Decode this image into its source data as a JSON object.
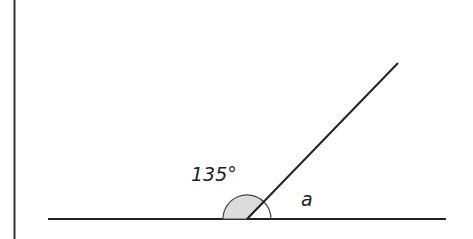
{
  "diagram": {
    "type": "angle-on-straight-line",
    "labels": {
      "known_angle": "135°",
      "unknown_angle": "a"
    },
    "colors": {
      "line": "#222222",
      "shaded_sector": "#dcdcdc",
      "background": "#ffffff"
    }
  }
}
